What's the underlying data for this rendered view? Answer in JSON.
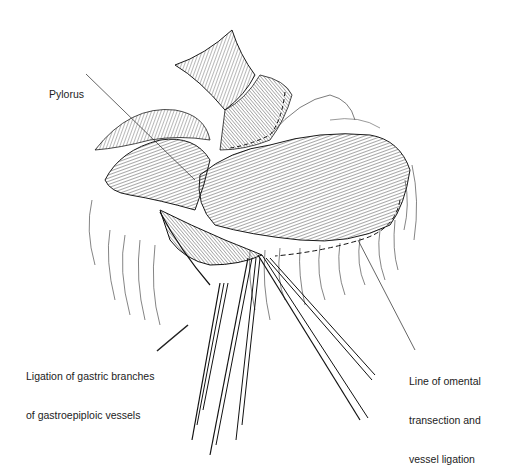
{
  "figure": {
    "style": "black-and-white pen line drawing",
    "colors": {
      "ink": "#1a1a1a",
      "background": "#ffffff",
      "label_text": "#222222"
    }
  },
  "labels": {
    "pylorus": {
      "lines": [
        "Pylorus"
      ]
    },
    "ligation": {
      "lines": [
        "Ligation of gastric branches",
        "of gastroepiploic vessels"
      ]
    },
    "omental_line": {
      "lines": [
        "Line of omental",
        "transection and",
        "vessel ligation"
      ]
    }
  }
}
